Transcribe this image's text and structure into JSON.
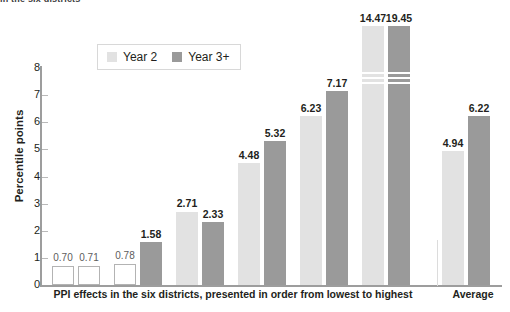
{
  "clipped_header": "in the six districts",
  "legend": {
    "position": "top-center-inside",
    "items": [
      {
        "label": "Year 2",
        "color": "#e2e2e2",
        "swatch": "light"
      },
      {
        "label": "Year 3+",
        "color": "#9a9a9a",
        "swatch": "dark"
      }
    ]
  },
  "axes": {
    "ylabel": "Percentile points",
    "yticks": [
      "0",
      "1",
      "2",
      "3",
      "4",
      "5",
      "6",
      "7",
      "8"
    ],
    "xlabel_main": "PPI effects in the six districts, presented in order from lowest to highest",
    "xlabel_average": "Average"
  },
  "chart_data": {
    "type": "bar",
    "title": "",
    "xlabel": "PPI effects in the six districts, presented in order from lowest to highest",
    "ylabel": "Percentile points",
    "ylim": [
      0,
      8
    ],
    "yticks": [
      0,
      1,
      2,
      3,
      4,
      5,
      6,
      7,
      8
    ],
    "grid": false,
    "legend_position": "top-center",
    "axis_break": {
      "applies_to": [
        "District 6 Year 2",
        "District 6 Year 3+"
      ],
      "note": "bars exceed the 0-8 axis and are drawn with a break"
    },
    "categories": [
      "District 1",
      "District 2",
      "District 3",
      "District 4",
      "District 5",
      "District 6",
      "Average"
    ],
    "series": [
      {
        "name": "Year 2",
        "color": "#e2e2e2",
        "values": [
          0.7,
          0.78,
          2.71,
          4.48,
          6.23,
          14.47,
          4.94
        ]
      },
      {
        "name": "Year 3+",
        "color": "#9a9a9a",
        "values": [
          0.71,
          1.58,
          2.33,
          5.32,
          7.17,
          19.45,
          6.22
        ]
      }
    ],
    "data_labels": [
      "0.70",
      "0.71",
      "0.78",
      "1.58",
      "2.71",
      "2.33",
      "4.48",
      "5.32",
      "6.23",
      "7.17",
      "14.47",
      "19.45",
      "4.94",
      "6.22"
    ]
  }
}
